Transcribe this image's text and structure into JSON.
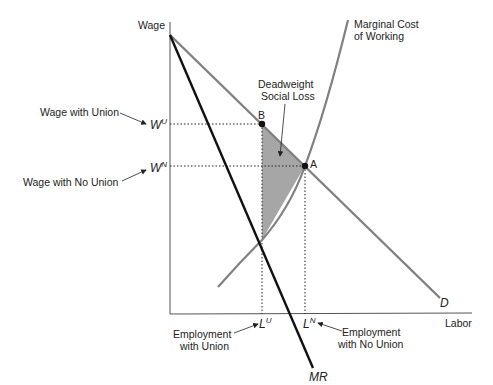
{
  "diagram": {
    "axes": {
      "y_label": "Wage",
      "x_label": "Labor"
    },
    "curves": {
      "demand": {
        "label": "D",
        "color": "#808080"
      },
      "marginal_revenue": {
        "label": "MR",
        "color": "#111111"
      },
      "marginal_cost": {
        "label_line1": "Marginal Cost",
        "label_line2": "of Working",
        "color": "#808080"
      }
    },
    "points": {
      "union": {
        "label": "B"
      },
      "competitive": {
        "label": "A"
      }
    },
    "wage_levels": {
      "union": {
        "symbol": "W",
        "sup": "U",
        "annotation": "Wage with Union"
      },
      "no_union": {
        "symbol": "W",
        "sup": "N",
        "annotation": "Wage with No Union"
      }
    },
    "employment_levels": {
      "union": {
        "symbol": "L",
        "sup": "U",
        "annotation_line1": "Employment",
        "annotation_line2": "with Union"
      },
      "no_union": {
        "symbol": "L",
        "sup": "N",
        "annotation_line1": "Employment",
        "annotation_line2": "with No Union"
      }
    },
    "shaded_region": {
      "label_line1": "Deadweight",
      "label_line2": "Social Loss",
      "color": "#a6a6a6"
    }
  }
}
